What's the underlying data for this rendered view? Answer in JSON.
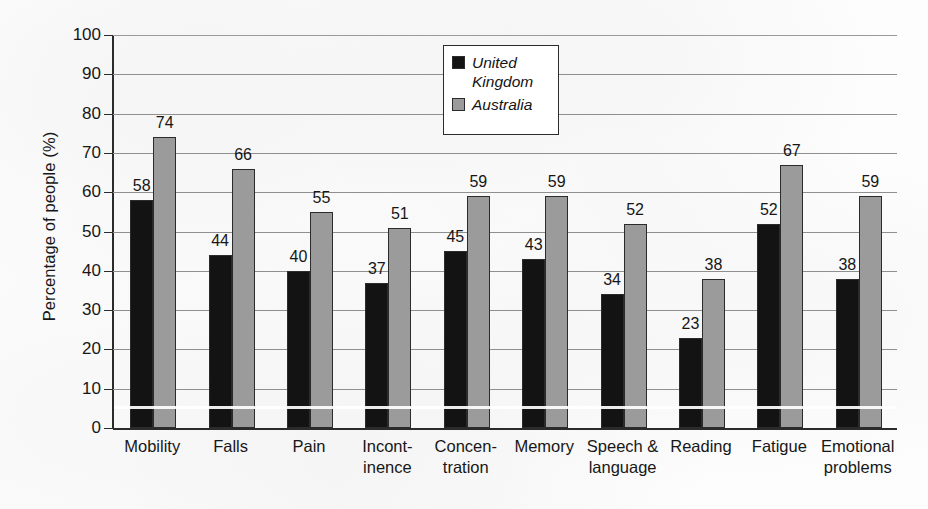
{
  "chart_data": {
    "type": "bar",
    "title": "",
    "xlabel": "",
    "ylabel": "Percentage of people (%)",
    "ylim": [
      0,
      100
    ],
    "ytick_step": 10,
    "yticks": [
      "0",
      "10",
      "20",
      "30",
      "40",
      "50",
      "60",
      "70",
      "80",
      "90",
      "100"
    ],
    "grid": true,
    "legend_position": "top-center-right",
    "categories": [
      "Mobility",
      "Falls",
      "Pain",
      "Incont-\ninence",
      "Concen-\ntration",
      "Memory",
      "Speech &\nlanguage",
      "Reading",
      "Fatigue",
      "Emotional\nproblems"
    ],
    "category_lines": [
      [
        "Mobility"
      ],
      [
        "Falls"
      ],
      [
        "Pain"
      ],
      [
        "Incont-",
        "inence"
      ],
      [
        "Concen-",
        "tration"
      ],
      [
        "Memory"
      ],
      [
        "Speech &",
        "language"
      ],
      [
        "Reading"
      ],
      [
        "Fatigue"
      ],
      [
        "Emotional",
        "problems"
      ]
    ],
    "series": [
      {
        "name": "United Kingdom",
        "name_lines": [
          "United",
          "Kingdom"
        ],
        "color": "#131313",
        "values": [
          58,
          44,
          40,
          37,
          45,
          43,
          34,
          23,
          52,
          38
        ]
      },
      {
        "name": "Australia",
        "name_lines": [
          "Australia"
        ],
        "color": "#9b9b9b",
        "values": [
          74,
          66,
          55,
          51,
          59,
          59,
          52,
          38,
          67,
          59
        ]
      }
    ]
  },
  "legend": {
    "items": [
      {
        "label": "United Kingdom",
        "swatch": "uk"
      },
      {
        "label": "Australia",
        "swatch": "au"
      }
    ]
  },
  "axis": {
    "y_title": "Percentage of people (%)"
  }
}
